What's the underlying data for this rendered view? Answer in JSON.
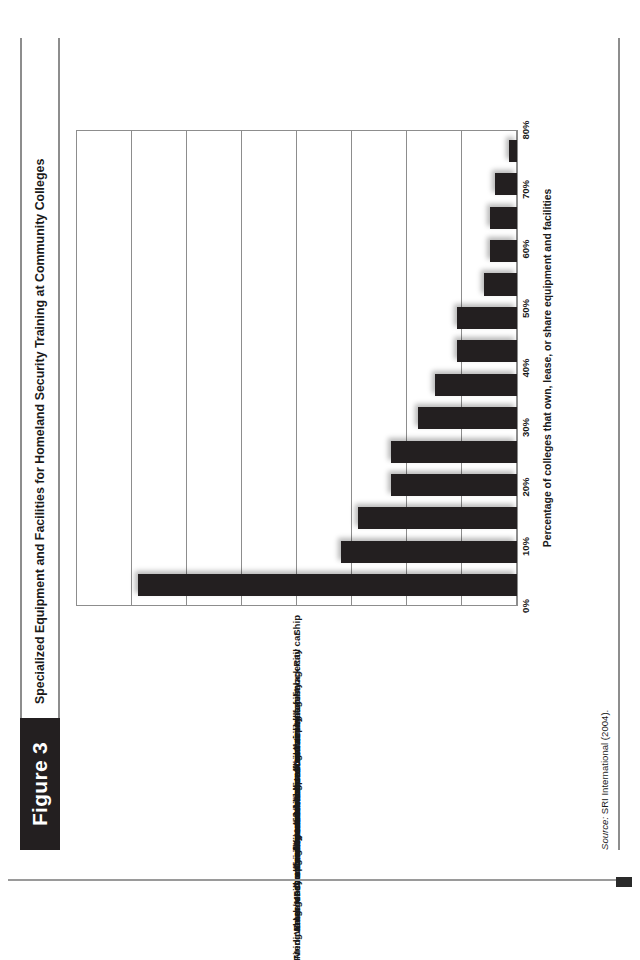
{
  "figure": {
    "tab_label": "Figure 3",
    "title": "Specialized Equipment and Facilities for Homeland Security Training at Community Colleges",
    "source_prefix": "Source:",
    "source_text": " SRI International (2004)."
  },
  "colors": {
    "bar": "#231f20",
    "tab_background": "#231f20",
    "tab_text": "#ffffff",
    "rule": "#8d8d8d",
    "gridline": "#8d8d8d",
    "text": "#1a1a1a",
    "page_background": "#ffffff"
  },
  "chart_data": {
    "type": "bar",
    "title": "Specialized Equipment and Facilities for Homeland Security Training at Community Colleges",
    "xlabel": "",
    "ylabel": "Percentage of colleges that own, lease, or share equipment and facilities",
    "ylim": [
      0,
      80
    ],
    "ytick_labels": [
      "0%",
      "10%",
      "20%",
      "30%",
      "40%",
      "50%",
      "60%",
      "70%",
      "80%"
    ],
    "ytick_values": [
      0,
      10,
      20,
      30,
      40,
      50,
      60,
      70,
      80
    ],
    "grid": true,
    "legend": false,
    "orientation": "vertical-rotated-90ccw",
    "categories": [
      "Medical lab/Medical facility",
      "Firing range or shooting house",
      "Fire engine/fire truck",
      "Burn building",
      "Driving track/skid pad",
      "Confined space/trench rescue",
      "Emergency communications control center",
      "Water rescue pond or swift water rescue facility",
      "Aviation/flight simulator",
      "Industrial disaster training facility",
      "Commercial airplane fuselage",
      "Disaster village/mock city",
      "Rail car",
      "Ship"
    ],
    "values": [
      69,
      32,
      29,
      23,
      23,
      18,
      15,
      11,
      11,
      6,
      5,
      5,
      4,
      1.5
    ]
  }
}
